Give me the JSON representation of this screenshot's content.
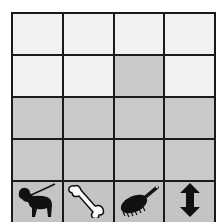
{
  "chart_data": {
    "type": "bar",
    "title": "",
    "xlabel": "",
    "ylabel": "",
    "categories": [
      "dog-on-leash",
      "bone",
      "brush",
      "up-down-arrow"
    ],
    "values": [
      2,
      2,
      3,
      2
    ],
    "ylim": [
      0,
      4
    ],
    "grid": true,
    "rows": 4,
    "colors": {
      "filled": "#c9c9c9",
      "empty": "#f1f1f1",
      "gridline": "#1a1a1a"
    }
  },
  "icons": [
    "dog-on-leash-icon",
    "bone-icon",
    "brush-icon",
    "up-down-arrow-icon"
  ]
}
